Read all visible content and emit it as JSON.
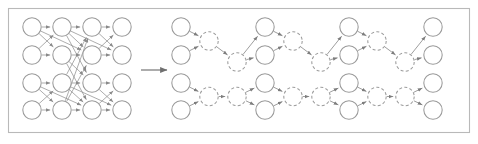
{
  "figure": {
    "width": 478,
    "height": 144,
    "background_color": "#ffffff",
    "frame": {
      "x": 8,
      "y": 8,
      "width": 462,
      "height": 125,
      "stroke_color": "#b9b9b9"
    },
    "colors": {
      "node_stroke": "#9a9a9a",
      "node_fill": "#ffffff",
      "edge_stroke": "#7d7d7d",
      "dense_edge_stroke": "#8a8a8a",
      "arrow_stroke": "#6f6f6f",
      "frame_stroke": "#b9b9b9"
    },
    "node_radius": 9.2,
    "labels": {
      "left_panel": "dense network",
      "right_panel": "butterfly factorization",
      "arrow": "transforms-into"
    }
  },
  "chart_data": {
    "type": "diagram",
    "panels": [
      {
        "id": "dense",
        "name": "dense-network",
        "columns": 4,
        "rows": 4,
        "node_style": "solid",
        "column_x": [
          32,
          62,
          92,
          122
        ],
        "row_y": [
          27,
          55,
          83,
          110
        ],
        "description": "Fully connected style layered network with many crossing edges"
      },
      {
        "id": "butterfly",
        "name": "butterfly-network",
        "stages": 7,
        "node_style": "alternating solid and dashed",
        "column_x": [
          181,
          209,
          237,
          265,
          293,
          321,
          349,
          377,
          405,
          433
        ],
        "row_y": [
          27,
          55,
          83,
          110
        ],
        "description": "Sparse factorized butterfly with hourglass merge and expand stages"
      }
    ],
    "arrow": {
      "from_x": 141,
      "to_x": 168,
      "y": 70,
      "direction": "right"
    },
    "dense_edges": [
      [
        0,
        0,
        1,
        0
      ],
      [
        0,
        0,
        1,
        1
      ],
      [
        0,
        1,
        1,
        0
      ],
      [
        0,
        1,
        1,
        1
      ],
      [
        0,
        2,
        1,
        2
      ],
      [
        0,
        2,
        1,
        3
      ],
      [
        0,
        3,
        1,
        2
      ],
      [
        0,
        3,
        1,
        3
      ],
      [
        1,
        0,
        2,
        0
      ],
      [
        1,
        0,
        2,
        2
      ],
      [
        1,
        1,
        2,
        1
      ],
      [
        1,
        1,
        2,
        3
      ],
      [
        1,
        2,
        2,
        0
      ],
      [
        1,
        2,
        2,
        2
      ],
      [
        1,
        3,
        2,
        1
      ],
      [
        1,
        3,
        2,
        3
      ],
      [
        2,
        0,
        3,
        0
      ],
      [
        2,
        0,
        3,
        1
      ],
      [
        2,
        1,
        3,
        0
      ],
      [
        2,
        1,
        3,
        1
      ],
      [
        2,
        2,
        3,
        2
      ],
      [
        2,
        2,
        3,
        3
      ],
      [
        2,
        3,
        3,
        2
      ],
      [
        2,
        3,
        3,
        3
      ],
      [
        1,
        0,
        2,
        1
      ],
      [
        1,
        1,
        2,
        2
      ],
      [
        1,
        2,
        2,
        3
      ],
      [
        1,
        3,
        2,
        0
      ],
      [
        0,
        0,
        2,
        1
      ],
      [
        0,
        2,
        2,
        3
      ],
      [
        1,
        0,
        3,
        1
      ],
      [
        1,
        2,
        3,
        3
      ]
    ],
    "butterfly_columns": [
      {
        "index": 0,
        "x": 181,
        "style": "solid",
        "rows": [
          0,
          1,
          2,
          3
        ]
      },
      {
        "index": 1,
        "x": 209,
        "style": "dashed",
        "rows": [
          0,
          2
        ]
      },
      {
        "index": 2,
        "x": 237,
        "style": "dashed",
        "rows": [
          1,
          2
        ]
      },
      {
        "index": 3,
        "x": 265,
        "style": "solid",
        "rows": [
          0,
          1,
          2,
          3
        ]
      },
      {
        "index": 4,
        "x": 293,
        "style": "dashed",
        "rows": [
          0,
          2
        ]
      },
      {
        "index": 5,
        "x": 321,
        "style": "dashed",
        "rows": [
          1,
          2
        ]
      },
      {
        "index": 6,
        "x": 349,
        "style": "solid",
        "rows": [
          0,
          1,
          2,
          3
        ]
      },
      {
        "index": 7,
        "x": 377,
        "style": "dashed",
        "rows": [
          0,
          2
        ]
      },
      {
        "index": 8,
        "x": 405,
        "style": "dashed",
        "rows": [
          1,
          2
        ]
      },
      {
        "index": 9,
        "x": 433,
        "style": "solid",
        "rows": [
          0,
          1,
          2,
          3
        ]
      }
    ],
    "xlabel": "",
    "ylabel": "",
    "grid": false,
    "legend": null
  }
}
